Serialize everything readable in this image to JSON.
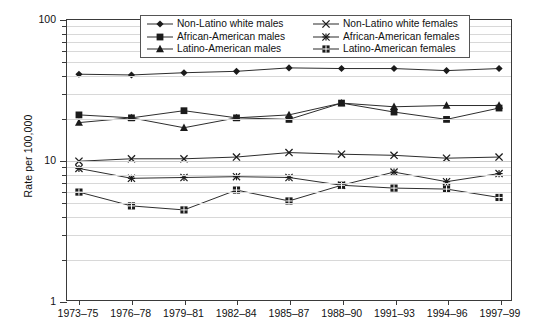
{
  "chart_data": {
    "type": "line",
    "title": "",
    "xlabel": "",
    "ylabel": "Rate per 100,000",
    "yscale": "log",
    "ylim": [
      1,
      100
    ],
    "ytick_labels": [
      "100",
      "10",
      "1"
    ],
    "ytick_values": [
      100,
      10,
      1
    ],
    "grid": true,
    "legend_position": "top-center",
    "legend_columns": 2,
    "categories": [
      "1973–75",
      "1976–78",
      "1979–81",
      "1982–84",
      "1985–87",
      "1988–90",
      "1991–93",
      "1994–96",
      "1997–99"
    ],
    "series": [
      {
        "name": "Non-Latino white males",
        "marker": "diamond",
        "values": [
          41.0,
          40.5,
          42.0,
          43.0,
          45.5,
          45.0,
          45.0,
          43.5,
          45.0
        ]
      },
      {
        "name": "African-American males",
        "marker": "square",
        "values": [
          21.0,
          20.0,
          22.5,
          20.0,
          19.5,
          25.5,
          22.0,
          19.5,
          23.5
        ]
      },
      {
        "name": "Latino-American males",
        "marker": "triangle",
        "values": [
          18.5,
          20.0,
          17.0,
          20.0,
          21.0,
          25.5,
          24.0,
          24.5,
          24.5
        ]
      },
      {
        "name": "Non-Latino white females",
        "marker": "xcross",
        "values": [
          9.8,
          10.2,
          10.2,
          10.5,
          11.3,
          11.0,
          10.8,
          10.3,
          10.5
        ]
      },
      {
        "name": "African-American females",
        "marker": "star",
        "values": [
          8.7,
          7.4,
          7.5,
          7.6,
          7.5,
          6.6,
          8.2,
          7.0,
          8.0
        ]
      },
      {
        "name": "Latino-American females",
        "marker": "sqdot",
        "values": [
          5.9,
          4.7,
          4.4,
          6.1,
          5.1,
          6.6,
          6.3,
          6.2,
          5.4
        ]
      }
    ]
  },
  "axis": {
    "y_title": "Rate per 100,000",
    "y_ticks": [
      "100",
      "10",
      "1"
    ],
    "x_ticks": [
      "1973–75",
      "1976–78",
      "1979–81",
      "1982–84",
      "1985–87",
      "1988–90",
      "1991–93",
      "1994–96",
      "1997–99"
    ]
  },
  "legend": {
    "column_left": [
      {
        "label": "Non-Latino white males",
        "marker": "diamond"
      },
      {
        "label": "African-American males",
        "marker": "square"
      },
      {
        "label": "Latino-American males",
        "marker": "triangle"
      }
    ],
    "column_right": [
      {
        "label": "Non-Latino white females",
        "marker": "xcross"
      },
      {
        "label": "African-American females",
        "marker": "star"
      },
      {
        "label": "Latino-American females",
        "marker": "sqdot"
      }
    ]
  },
  "colors": {
    "line": "#2b2b2b",
    "marker": "#1b1b1b",
    "grid": "#d8d8d8",
    "axis": "#3a3a3a",
    "background": "#ffffff"
  }
}
